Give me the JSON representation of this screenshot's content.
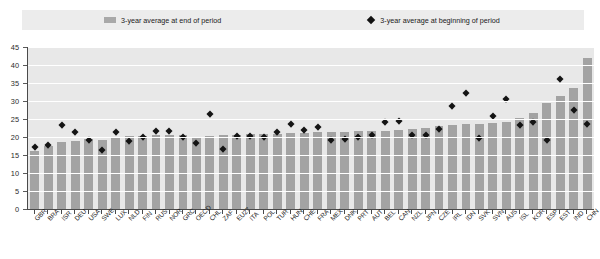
{
  "legend": {
    "items": [
      {
        "label": "3-year average at end of period",
        "marker": "bar-swatch-icon",
        "color": "#a3a3a3"
      },
      {
        "label": "3-year average at beginning of period",
        "marker": "diamond-marker-icon",
        "color": "#141414"
      }
    ]
  },
  "chart_data": {
    "type": "bar",
    "title": "",
    "subtitle": "",
    "xlabel": "",
    "ylabel": "",
    "ylim": [
      0,
      45
    ],
    "yticks": [
      0,
      5,
      10,
      15,
      20,
      25,
      30,
      35,
      40,
      45
    ],
    "grid": true,
    "legend_position": "top",
    "categories": [
      "GBR",
      "BRA",
      "ISR",
      "DEU",
      "USA",
      "SWE",
      "LUX",
      "NLD",
      "FIN",
      "RUS",
      "NOR",
      "GRC",
      "OECD",
      "CHL",
      "ZAF",
      "EU27",
      "ITA",
      "POL",
      "TUR",
      "HUN",
      "CHE",
      "FRA",
      "MEX",
      "DNK",
      "PRT",
      "AUT",
      "BEL",
      "CAN",
      "NZL",
      "JPN",
      "CZE",
      "IRL",
      "IDN",
      "SVK",
      "SVN",
      "AUS",
      "ISL",
      "KOR",
      "ESP",
      "EST",
      "IND",
      "CHN"
    ],
    "series": [
      {
        "name": "3-year average at end of period",
        "type": "bar",
        "color": "#a3a3a3",
        "values": [
          16.0,
          17.5,
          18.5,
          19.0,
          19.5,
          19.3,
          19.8,
          20.3,
          20.4,
          20.5,
          20.5,
          20.6,
          19.9,
          20.2,
          20.5,
          20.6,
          20.7,
          20.8,
          20.9,
          21.0,
          21.2,
          21.3,
          21.4,
          21.5,
          21.6,
          21.7,
          21.8,
          22.0,
          22.3,
          22.5,
          23.0,
          23.4,
          23.5,
          23.6,
          24.0,
          24.3,
          25.2,
          26.8,
          29.5,
          31.5,
          33.5,
          42.0
        ]
      },
      {
        "name": "3-year average at beginning of period",
        "type": "scatter",
        "color": "#141414",
        "values": [
          17.0,
          17.8,
          23.2,
          21.2,
          19.0,
          16.2,
          21.3,
          18.8,
          20.0,
          21.5,
          21.6,
          19.8,
          18.2,
          26.3,
          16.5,
          20.1,
          20.2,
          20.0,
          21.2,
          23.5,
          21.8,
          22.8,
          19.1,
          19.4,
          20.0,
          20.5,
          24.2,
          24.3,
          20.5,
          20.4,
          22.2,
          28.5,
          32.0,
          19.5,
          25.8,
          30.5,
          23.2,
          24.0,
          19.0,
          36.0,
          27.5,
          23.5
        ]
      }
    ]
  }
}
